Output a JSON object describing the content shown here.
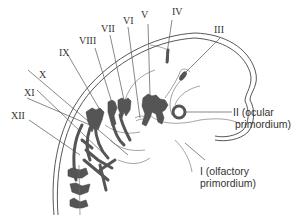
{
  "diagram": {
    "labels": {
      "n1": "I (olfactory",
      "n1b": "primordium)",
      "n2": "II (ocular",
      "n2b": "primordium)",
      "n3": "III",
      "n4": "IV",
      "n5": "V",
      "n6": "VI",
      "n7": "VII",
      "n8": "VIII",
      "n9": "IX",
      "n10": "X",
      "n11": "XI",
      "n12": "XII"
    },
    "colors": {
      "nerve_fill": "#555555",
      "line": "#444444",
      "text": "#333333",
      "background": "#ffffff"
    }
  }
}
